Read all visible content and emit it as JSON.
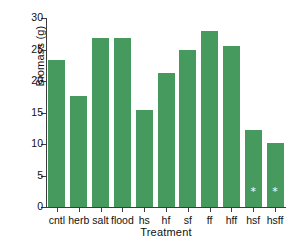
{
  "chart_data": {
    "type": "bar",
    "title": "",
    "xlabel": "Treatment",
    "ylabel": "Biomass (g)",
    "categories": [
      "cntl",
      "herb",
      "salt",
      "flood",
      "hs",
      "hf",
      "sf",
      "ff",
      "hff",
      "hsf",
      "hsff"
    ],
    "values": [
      23.3,
      17.6,
      26.8,
      26.8,
      15.4,
      21.3,
      25.0,
      28.0,
      25.6,
      12.3,
      10.2
    ],
    "ylim": [
      0,
      30
    ],
    "yticks": [
      0,
      5,
      10,
      15,
      20,
      25,
      30
    ],
    "ytick_labels": [
      "0",
      "5",
      "10",
      "15",
      "20",
      "25",
      "30"
    ],
    "grid": false,
    "legend": null,
    "bar_color": "#469a5d",
    "annotations": [
      {
        "category": "hsf",
        "marker": "*",
        "color": "#ffffff"
      },
      {
        "category": "hsff",
        "marker": "*",
        "color": "#ffffff"
      }
    ]
  }
}
